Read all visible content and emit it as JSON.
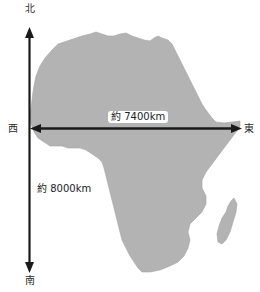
{
  "diagram": {
    "directions": {
      "north": "北",
      "south": "南",
      "west": "西",
      "east": "東"
    },
    "measurements": {
      "east_west": "約 7400km",
      "north_south": "約 8000km"
    },
    "colors": {
      "continent_fill": "#b3b3b3",
      "arrow": "#1a1a1a",
      "background": "#ffffff",
      "text": "#2a2a2a"
    },
    "icons": {
      "continent": "africa-map-shape",
      "island": "madagascar-shape",
      "ns_arrow": "double-arrow-vertical",
      "ew_arrow": "double-arrow-horizontal"
    }
  }
}
